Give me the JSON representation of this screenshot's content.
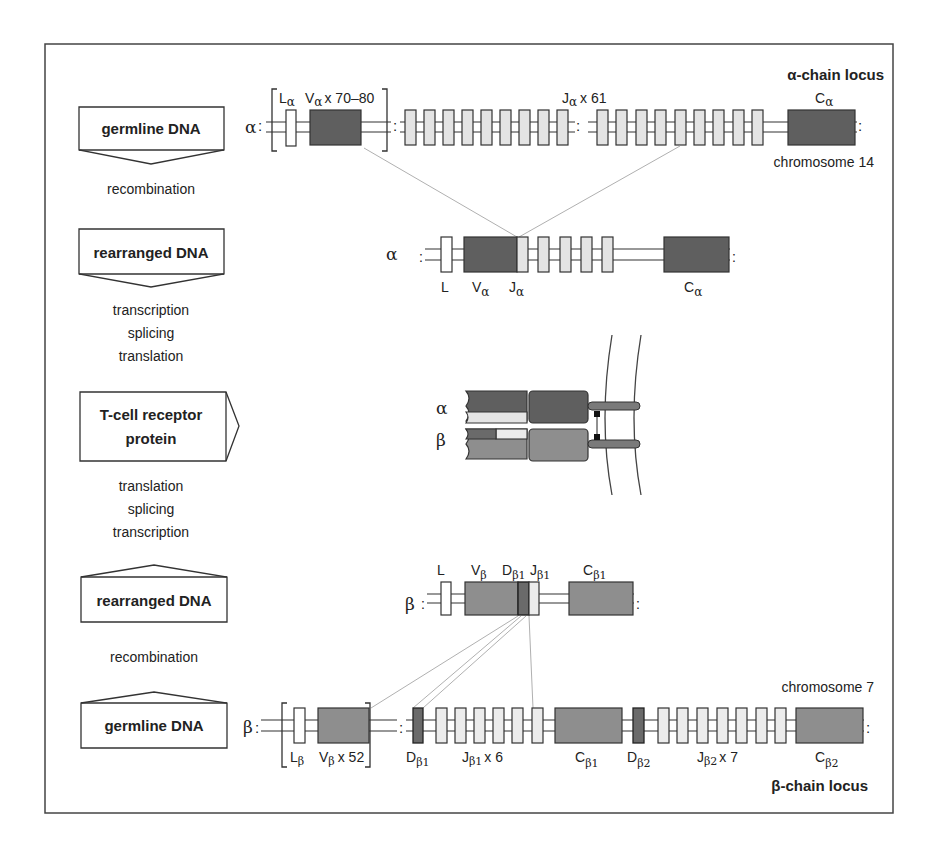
{
  "flow": {
    "box_germline_top": "germline DNA",
    "step_recombination_top": "recombination",
    "box_rearranged_top": "rearranged DNA",
    "steps_middle_top": [
      "transcription",
      "splicing",
      "translation"
    ],
    "box_protein_line1": "T-cell receptor",
    "box_protein_line2": "protein",
    "steps_middle_bottom": [
      "translation",
      "splicing",
      "transcription"
    ],
    "box_rearranged_bottom": "rearranged DNA",
    "step_recombination_bottom": "recombination",
    "box_germline_bottom": "germline DNA"
  },
  "alpha_locus": {
    "title": "α-chain locus",
    "chain_symbol": "α",
    "chromosome": "chromosome 14",
    "L_label": "L",
    "L_sub": "α",
    "V_label": "V",
    "V_sub": "α",
    "V_count": "x 70–80",
    "J_label": "J",
    "J_sub": "α",
    "J_count": "x 61",
    "C_label": "C",
    "C_sub": "α"
  },
  "alpha_rearranged": {
    "chain_symbol": "α",
    "L_label": "L",
    "V_label": "V",
    "V_sub": "α",
    "J_label": "J",
    "J_sub": "α",
    "C_label": "C",
    "C_sub": "α"
  },
  "protein": {
    "alpha_symbol": "α",
    "beta_symbol": "β"
  },
  "beta_rearranged": {
    "chain_symbol": "β",
    "L_label": "L",
    "V_label": "V",
    "V_sub": "β",
    "D_label": "D",
    "D_sub": "β1",
    "J_label": "J",
    "J_sub": "β1",
    "C_label": "C",
    "C_sub": "β1"
  },
  "beta_locus": {
    "title": "β-chain locus",
    "chain_symbol": "β",
    "chromosome": "chromosome 7",
    "L_label": "L",
    "L_sub": "β",
    "V_label": "V",
    "V_sub": "β",
    "V_count": "x 52",
    "D1_label": "D",
    "D1_sub": "β1",
    "J1_label": "J",
    "J1_sub": "β1",
    "J1_count": "x 6",
    "C1_label": "C",
    "C1_sub": "β1",
    "D2_label": "D",
    "D2_sub": "β2",
    "J2_label": "J",
    "J2_sub": "β2",
    "J2_count": "x 7",
    "C2_label": "C",
    "C2_sub": "β2"
  },
  "colors": {
    "alpha_segment": "#5f5f5f",
    "beta_segment": "#8e8e8e",
    "d_segment": "#6a6a6a",
    "j_segment": "#e4e4e4",
    "leader": "#ffffff",
    "stroke": "#333333",
    "connector": "#b0b0b0"
  }
}
